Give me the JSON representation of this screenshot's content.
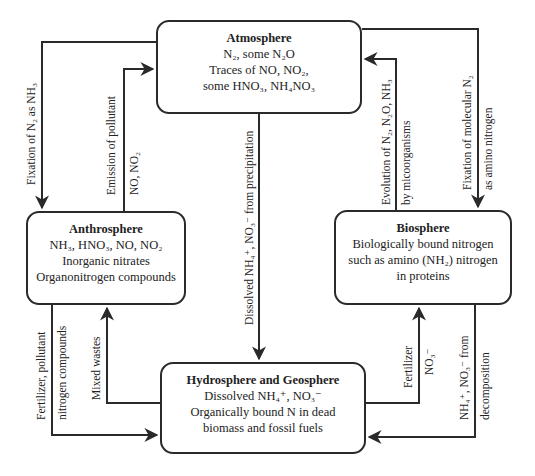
{
  "diagram": {
    "type": "nitrogen-cycle",
    "boxes": {
      "atmosphere": {
        "title": "Atmosphere",
        "lines": [
          "N₂, some N₂O",
          "Traces of NO, NO₂,",
          "some HNO₃, NH₄NO₃"
        ]
      },
      "anthrosphere": {
        "title": "Anthrosphere",
        "lines": [
          "NH₃, HNO₃, NO, NO₂",
          "Inorganic nitrates",
          "Organonitrogen compounds"
        ]
      },
      "biosphere": {
        "title": "Biosphere",
        "lines": [
          "Biologically bound nitrogen",
          "such as amino (NH₂) nitrogen",
          "in proteins"
        ]
      },
      "hydrosphere": {
        "title": "Hydrosphere and Geosphere",
        "lines": [
          "Dissolved NH₄⁺, NO₃⁻",
          "Organically bound N in dead",
          "biomass and fossil fuels"
        ]
      }
    },
    "arrows": {
      "fixation_nh3": {
        "from": "Atmosphere",
        "to": "Anthrosphere",
        "label": "Fixation of N₂ as NH₃"
      },
      "emission": {
        "from": "Anthrosphere",
        "to": "Atmosphere",
        "label1": "Emission of pollutant",
        "label2": "NO, NO₂"
      },
      "precipitation": {
        "from": "Atmosphere",
        "to": "Hydrosphere and Geosphere",
        "label": "Dissolved NH₄⁺, NO₃⁻ from precipitation"
      },
      "evolution": {
        "from": "Biosphere",
        "to": "Atmosphere",
        "label1": "Evolution of N₂, N₂O, NH₃",
        "label2": "by micoorganisms"
      },
      "fixation_amino": {
        "from": "Atmosphere",
        "to": "Biosphere",
        "label1": "Fixation of molecular N₂",
        "label2": "as amino nitrogen"
      },
      "fertilizer_pollutant": {
        "from": "Anthrosphere",
        "to": "Hydrosphere and Geosphere",
        "label1": "Fertilizer, pollutant",
        "label2": "nitrogen compounds"
      },
      "mixed_wastes": {
        "from": "Hydrosphere and Geosphere",
        "to": "Anthrosphere",
        "label": "Mixed wastes"
      },
      "fertilizer_no3": {
        "from": "Hydrosphere and Geosphere",
        "to": "Biosphere",
        "label1": "Fertilizer",
        "label2": "NO₃⁻"
      },
      "decomposition": {
        "from": "Biosphere",
        "to": "Hydrosphere and Geosphere",
        "label1": "NH₄⁺, NO₃⁻ from",
        "label2": "decomposition"
      }
    },
    "colors": {
      "line": "#2a2a2a",
      "background": "#ffffff",
      "text": "#222222"
    }
  }
}
